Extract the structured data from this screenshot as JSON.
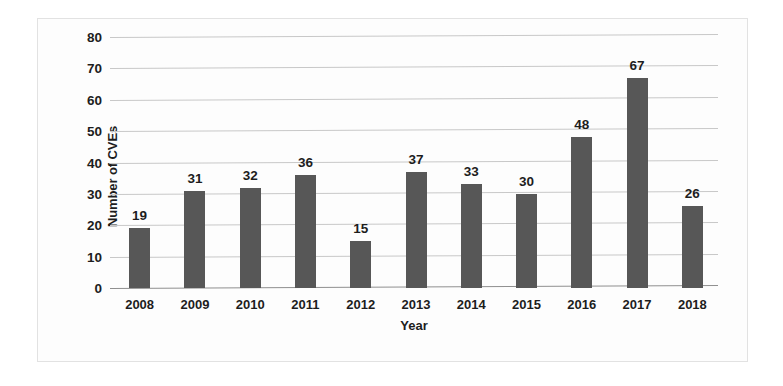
{
  "chart_data": {
    "type": "bar",
    "title": "",
    "xlabel": "Year",
    "ylabel": "Number of CVEs",
    "categories": [
      "2008",
      "2009",
      "2010",
      "2011",
      "2012",
      "2013",
      "2014",
      "2015",
      "2016",
      "2017",
      "2018"
    ],
    "values": [
      19,
      31,
      32,
      36,
      15,
      37,
      33,
      30,
      48,
      67,
      26
    ],
    "data_labels": [
      "19",
      "31",
      "32",
      "36",
      "15",
      "37",
      "33",
      "30",
      "48",
      "67",
      "26"
    ],
    "ylim": [
      0,
      80
    ],
    "yticks": [
      0,
      10,
      20,
      30,
      40,
      50,
      60,
      70,
      80
    ],
    "ytick_labels": [
      "0",
      "10",
      "20",
      "30",
      "40",
      "50",
      "60",
      "70",
      "80"
    ],
    "grid": true,
    "legend": false,
    "bar_color": "#575757",
    "gridline_color": "#c8c8c8",
    "axis_color": "#8f8f8f",
    "text_color": "#1d1d1d",
    "background": "#fdfdfd"
  }
}
